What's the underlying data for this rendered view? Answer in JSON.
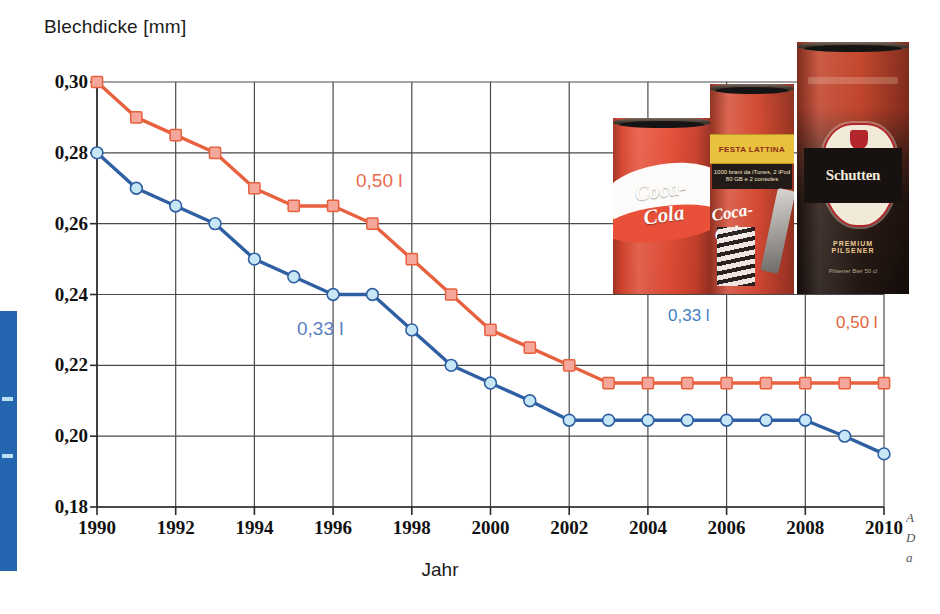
{
  "figure": {
    "y_axis_title": "Blechdicke [mm]",
    "x_axis_title": "Jahr"
  },
  "series_labels": {
    "red_in_plot": "0,50 l",
    "blue_in_plot": "0,33 l"
  },
  "can_legend": {
    "small_label": "0,33 l",
    "large_label": "0,50 l",
    "cans": [
      {
        "name": "coca-cola-can-short",
        "brand": "Coca-Cola"
      },
      {
        "name": "coca-cola-can-tall",
        "brand": "Coca-Cola",
        "band_top": "FESTA LATTINA",
        "band_sub": "1000 brani da iTunes, 2 iPod 80 GB e 2 consoles"
      },
      {
        "name": "schutten-beer-can",
        "brand": "Schutten",
        "sub": "Premium Pilsener",
        "sub2": "Bier",
        "arc": "PREMIUM PILSENER",
        "crest": "FAMIGLIA BIRRARIA",
        "foot": "Pilsener Bier 50 cl"
      }
    ]
  },
  "edge_caption": [
    "A",
    "D",
    "a"
  ],
  "colors": {
    "red_line": "#e8613f",
    "red_marker_fill": "#f4a79a",
    "blue_line": "#2e5fa3",
    "blue_marker_fill": "#c8e7f6",
    "grid": "#4a4a4a",
    "margin_tab": "#2566b0"
  },
  "chart_data": {
    "type": "line",
    "title": "",
    "xlabel": "Jahr",
    "ylabel": "Blechdicke [mm]",
    "xlim": [
      1990,
      2010
    ],
    "ylim": [
      0.18,
      0.3
    ],
    "ytick_labels": [
      "0,18",
      "0,20",
      "0,22",
      "0,24",
      "0,26",
      "0,28",
      "0,30"
    ],
    "yticks": [
      0.18,
      0.2,
      0.22,
      0.24,
      0.26,
      0.28,
      0.3
    ],
    "xtick_labels": [
      "1990",
      "1992",
      "1994",
      "1996",
      "1998",
      "2000",
      "2002",
      "2004",
      "2006",
      "2008",
      "2010"
    ],
    "xticks": [
      1990,
      1992,
      1994,
      1996,
      1998,
      2000,
      2002,
      2004,
      2006,
      2008,
      2010
    ],
    "grid": true,
    "legend_position": "in-plot annotations",
    "x": [
      1990,
      1991,
      1992,
      1993,
      1994,
      1995,
      1996,
      1997,
      1998,
      1999,
      2000,
      2001,
      2002,
      2003,
      2004,
      2005,
      2006,
      2007,
      2008,
      2009,
      2010
    ],
    "series": [
      {
        "name": "0,50 l",
        "color": "#e8613f",
        "marker": "square",
        "values": [
          0.3,
          0.29,
          0.285,
          0.28,
          0.27,
          0.265,
          0.265,
          0.26,
          0.25,
          0.24,
          0.23,
          0.225,
          0.22,
          0.215,
          0.215,
          0.215,
          0.215,
          0.215,
          0.215,
          0.215,
          0.215
        ]
      },
      {
        "name": "0,33 l",
        "color": "#2e5fa3",
        "marker": "circle",
        "values": [
          0.28,
          0.27,
          0.265,
          0.26,
          0.25,
          0.245,
          0.24,
          0.24,
          0.23,
          0.22,
          0.215,
          0.21,
          0.2045,
          0.2045,
          0.2045,
          0.2045,
          0.2045,
          0.2045,
          0.2045,
          0.2,
          0.195
        ]
      }
    ]
  }
}
